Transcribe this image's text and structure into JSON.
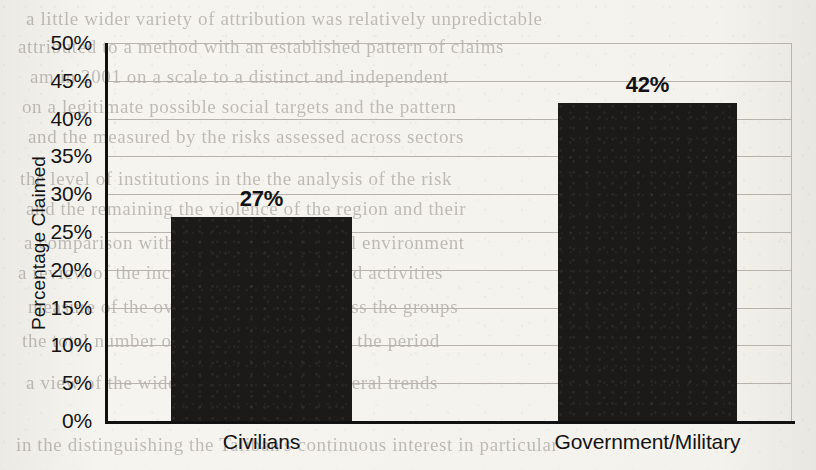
{
  "chart_data": {
    "type": "bar",
    "title": "",
    "subtitle": "",
    "xlabel": "",
    "ylabel": "Percentage Claimed",
    "categories": [
      "Civilians",
      "Government/Military"
    ],
    "values": [
      27,
      42
    ],
    "data_labels": [
      "27%",
      "42%"
    ],
    "ylim": [
      0,
      50
    ],
    "ytick_step": 5,
    "ytick_labels": [
      "50%",
      "45%",
      "40%",
      "35%",
      "30%",
      "25%",
      "20%",
      "15%",
      "10%",
      "5%",
      "0%"
    ],
    "ytick_values": [
      50,
      45,
      40,
      35,
      30,
      25,
      20,
      15,
      10,
      5,
      0
    ],
    "grid": "horizontal",
    "legend": "none",
    "series": [
      {
        "name": "Percentage Claimed",
        "values": [
          27,
          42
        ]
      }
    ],
    "colors": {
      "bar_fill": "#1b1a18",
      "axis": "#111111",
      "gridline": "#b7b3ac",
      "text": "#141414",
      "page_background": "#f3f1ec"
    }
  },
  "background_page": {
    "description": "scanned book page with faint bleed-through text behind the chart",
    "ghost_lines": [
      {
        "text": "a  little  wider  variety  of  attribution  was  relatively  unpredictable",
        "top": 8,
        "left": 26
      },
      {
        "text": "attributed  to  a  method  with  an  established  pattern  of  claims",
        "top": 36,
        "left": 18
      },
      {
        "text": "am  in  2001  on  a  scale  to  a  distinct  and  independent",
        "top": 66,
        "left": 30
      },
      {
        "text": "on  a  legitimate  possible  social  targets  and  the  pattern",
        "top": 96,
        "left": 22
      },
      {
        "text": "and  the  measured  by  the  risks  assessed  across  sectors",
        "top": 126,
        "left": 28
      },
      {
        "text": "the  level  of  institutions  in  the  the  analysis  of  the  risk",
        "top": 168,
        "left": 20
      },
      {
        "text": "and  the  remaining  the  violence  of  the  region  and  their",
        "top": 198,
        "left": 26
      },
      {
        "text": "a  comparison  with  the  risks  and  political  environment",
        "top": 232,
        "left": 24
      },
      {
        "text": "a  review  of  the  incidents  and  other  related  activities",
        "top": 262,
        "left": 18
      },
      {
        "text": "measure  of  the  overall  distribution  across  the  groups",
        "top": 296,
        "left": 28
      },
      {
        "text": "the  total  number  of  attacks  claimed  over  the  period",
        "top": 330,
        "left": 22
      },
      {
        "text": "a  view  of  the  wider  conflict  and  the  general  trends",
        "top": 372,
        "left": 26
      },
      {
        "text": "in  the  distinguishing  the  Taliban's  continuous  interest  in  particular",
        "top": 434,
        "left": 16
      }
    ]
  }
}
